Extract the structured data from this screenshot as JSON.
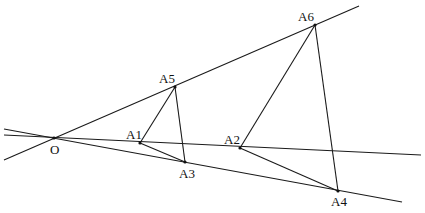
{
  "diagram": {
    "type": "geometry-construction",
    "points": {
      "O": {
        "label": "O",
        "x": 54,
        "y": 138,
        "label_x": 50,
        "label_y": 143
      },
      "A1": {
        "label": "A1",
        "x": 140,
        "y": 143,
        "label_x": 126,
        "label_y": 128
      },
      "A2": {
        "label": "A2",
        "x": 240,
        "y": 148,
        "label_x": 224,
        "label_y": 133
      },
      "A3": {
        "label": "A3",
        "x": 185,
        "y": 162,
        "label_x": 179,
        "label_y": 167
      },
      "A4": {
        "label": "A4",
        "x": 338,
        "y": 191,
        "label_x": 331,
        "label_y": 195
      },
      "A5": {
        "label": "A5",
        "x": 175,
        "y": 87,
        "label_x": 159,
        "label_y": 72
      },
      "A6": {
        "label": "A6",
        "x": 315,
        "y": 25,
        "label_x": 298,
        "label_y": 10
      }
    },
    "lines": [
      {
        "name": "ray-upper",
        "x1": 4,
        "y1": 160,
        "x2": 359,
        "y2": 6
      },
      {
        "name": "ray-middle",
        "x1": 4,
        "y1": 135,
        "x2": 421,
        "y2": 155
      },
      {
        "name": "ray-lower",
        "x1": 4,
        "y1": 129,
        "x2": 402,
        "y2": 202
      }
    ],
    "segments": [
      {
        "name": "A1-A5",
        "from": "A1",
        "to": "A5"
      },
      {
        "name": "A5-A3",
        "from": "A5",
        "to": "A3"
      },
      {
        "name": "A1-A3",
        "from": "A1",
        "to": "A3"
      },
      {
        "name": "A2-A6",
        "from": "A2",
        "to": "A6"
      },
      {
        "name": "A6-A4",
        "from": "A6",
        "to": "A4"
      },
      {
        "name": "A2-A4",
        "from": "A2",
        "to": "A4"
      }
    ],
    "colors": {
      "stroke": "#1a1a1a",
      "background": "#ffffff"
    }
  }
}
